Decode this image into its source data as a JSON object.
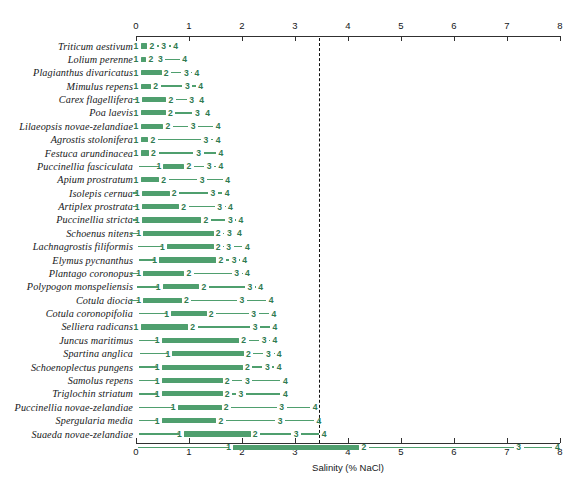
{
  "chart_data": {
    "type": "bar",
    "title": "",
    "xlabel": "Salinity (% NaCl)",
    "ylabel": "",
    "xlim": [
      0,
      8
    ],
    "xticks": [
      0,
      1,
      2,
      3,
      4,
      5,
      6,
      7,
      8
    ],
    "xtick_labels": [
      "0",
      "1",
      "2",
      "3",
      "4",
      "5",
      "6",
      "7",
      "8"
    ],
    "grid": false,
    "legend": "none",
    "annotations": [
      {
        "name": "seawater-threshold",
        "type": "vertical-dashed-line",
        "x": 3.45
      }
    ],
    "marker_labels": [
      "1",
      "2",
      "3",
      "4"
    ],
    "categories": [
      "Triticum aestivum",
      "Lolium perenne",
      "Plagianthus divaricatus",
      "Mimulus repens",
      "Carex flagellifera",
      "Poa laevis",
      "Lilaeopsis novae-zelandiae",
      "Agrostis stolonifera",
      "Festuca arundinacea",
      "Puccinellia fasciculata",
      "Apium prostratum",
      "Isolepis cernua",
      "Artiplex prostrata",
      "Puccinellia stricta",
      "Schoenus nitens",
      "Lachnagrostis filiformis",
      "Elymus pycnanthus",
      "Plantago coronopus",
      "Polypogon monspeliensis",
      "Cotula diocia",
      "Cotula coronopifolia",
      "Selliera radicans",
      "Juncus maritimus",
      "Spartina anglica",
      "Schoenoplectus pungens",
      "Samolus repens",
      "Triglochin striatum",
      "Puccinellia novae-zelandiae",
      "Spergularia media",
      "Suaeda novae-zelandiae"
    ],
    "series": [
      {
        "name": "Triticum aestivum",
        "start": 0.0,
        "p1": 0.0,
        "p2": 0.3,
        "p3": 0.52,
        "p4": 0.75
      },
      {
        "name": "Lolium perenne",
        "start": 0.0,
        "p1": 0.0,
        "p2": 0.28,
        "p3": 0.46,
        "p4": 0.92
      },
      {
        "name": "Plagianthus divaricatus",
        "start": 0.0,
        "p1": 0.0,
        "p2": 0.57,
        "p3": 0.95,
        "p4": 1.15
      },
      {
        "name": "Mimulus repens",
        "start": 0.0,
        "p1": 0.0,
        "p2": 0.37,
        "p3": 0.97,
        "p4": 1.22
      },
      {
        "name": "Carex flagellifera",
        "start": -0.05,
        "p1": 0.02,
        "p2": 0.66,
        "p3": 1.05,
        "p4": 1.24
      },
      {
        "name": "Poa laevis",
        "start": 0.0,
        "p1": 0.0,
        "p2": 0.65,
        "p3": 1.16,
        "p4": 1.35
      },
      {
        "name": "Lilaeopsis novae-zelandiae",
        "start": 0.0,
        "p1": 0.0,
        "p2": 0.6,
        "p3": 1.08,
        "p4": 1.55
      },
      {
        "name": "Agrostis stolonifera",
        "start": 0.0,
        "p1": 0.0,
        "p2": 0.32,
        "p3": 1.32,
        "p4": 1.55
      },
      {
        "name": "Festuca arundinacea",
        "start": 0.0,
        "p1": 0.0,
        "p2": 0.33,
        "p3": 1.18,
        "p4": 1.6
      },
      {
        "name": "Puccinellia fasciculata",
        "start": 0.06,
        "p1": 0.43,
        "p2": 1.0,
        "p3": 1.38,
        "p4": 1.6
      },
      {
        "name": "Apium prostratum",
        "start": 0.0,
        "p1": 0.0,
        "p2": 0.52,
        "p3": 1.25,
        "p4": 1.73
      },
      {
        "name": "Isolepis cernua",
        "start": -0.05,
        "p1": 0.02,
        "p2": 0.72,
        "p3": 1.45,
        "p4": 1.72
      },
      {
        "name": "Artiplex prostrata",
        "start": -0.05,
        "p1": 0.02,
        "p2": 0.9,
        "p3": 1.58,
        "p4": 1.78
      },
      {
        "name": "Puccinellia stricta",
        "start": -0.05,
        "p1": 0.02,
        "p2": 1.32,
        "p3": 1.78,
        "p4": 1.98
      },
      {
        "name": "Schoenus nitens",
        "start": -0.12,
        "p1": 0.05,
        "p2": 1.55,
        "p3": 1.76,
        "p4": 1.95
      },
      {
        "name": "Lachnagrostis filiformis",
        "start": 0.03,
        "p1": 0.5,
        "p2": 1.55,
        "p3": 1.75,
        "p4": 2.1
      },
      {
        "name": "Elymus pycnanthus",
        "start": 0.05,
        "p1": 0.35,
        "p2": 1.6,
        "p3": 1.85,
        "p4": 2.05
      },
      {
        "name": "Plantago coronopus",
        "start": -0.12,
        "p1": 0.05,
        "p2": 1.0,
        "p3": 1.9,
        "p4": 2.1
      },
      {
        "name": "Polypogon monspeliensis",
        "start": 0.02,
        "p1": 0.42,
        "p2": 1.28,
        "p3": 2.15,
        "p4": 2.35
      },
      {
        "name": "Cotula diocia",
        "start": -0.12,
        "p1": 0.05,
        "p2": 0.95,
        "p3": 2.0,
        "p4": 2.55
      },
      {
        "name": "Cotula coronopifolia",
        "start": 0.05,
        "p1": 0.58,
        "p2": 1.42,
        "p3": 2.22,
        "p4": 2.6
      },
      {
        "name": "Selliera radicans",
        "start": 0.0,
        "p1": 0.0,
        "p2": 1.07,
        "p3": 2.25,
        "p4": 2.62
      },
      {
        "name": "Juncus maritimus",
        "start": 0.05,
        "p1": 0.4,
        "p2": 2.03,
        "p3": 2.42,
        "p4": 2.62
      },
      {
        "name": "Spartina anglica",
        "start": 0.08,
        "p1": 0.6,
        "p2": 2.12,
        "p3": 2.5,
        "p4": 2.7
      },
      {
        "name": "Schoenoplectus pungens",
        "start": 0.05,
        "p1": 0.4,
        "p2": 2.1,
        "p3": 2.48,
        "p4": 2.7
      },
      {
        "name": "Samolus repens",
        "start": 0.05,
        "p1": 0.4,
        "p2": 1.72,
        "p3": 2.1,
        "p4": 2.82
      },
      {
        "name": "Triglochin striatum",
        "start": 0.05,
        "p1": 0.4,
        "p2": 1.72,
        "p3": 1.98,
        "p4": 2.82
      },
      {
        "name": "Puccinellia novae-zelandiae",
        "start": 0.05,
        "p1": 0.7,
        "p2": 1.7,
        "p3": 2.75,
        "p4": 3.38
      },
      {
        "name": "Spergularia media",
        "start": 0.05,
        "p1": 0.4,
        "p2": 1.6,
        "p3": 2.72,
        "p4": 3.45
      },
      {
        "name": "Sarcocornia quinqueflora",
        "start": 0.05,
        "p1": 0.82,
        "p2": 2.25,
        "p3": 3.02,
        "p4": 3.55
      },
      {
        "name": "Suaeda novae-zelandiae",
        "start": 0.03,
        "p1": 1.75,
        "p2": 4.3,
        "p3": 7.22,
        "p4": 7.95
      }
    ],
    "colors": {
      "bar": "#4f9f6e",
      "line": "#4f9f6e",
      "marker_text": "#2f7a50",
      "axis": "#303030",
      "threshold": "#111111"
    }
  }
}
